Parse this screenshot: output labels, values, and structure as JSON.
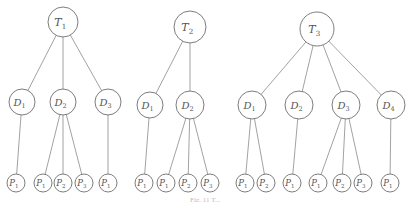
{
  "diagram": {
    "trees": [
      {
        "root": {
          "label": "T",
          "sub": "1",
          "x": 63,
          "y": 22,
          "r": 15
        },
        "children": [
          {
            "label": "D",
            "sub": "1",
            "x": 22,
            "y": 102,
            "r": 13,
            "children": [
              {
                "label": "P",
                "sub": "1",
                "x": 16,
                "y": 183
              }
            ]
          },
          {
            "label": "D",
            "sub": "2",
            "x": 63,
            "y": 102,
            "r": 13,
            "children": [
              {
                "label": "P",
                "sub": "1",
                "x": 43,
                "y": 183
              },
              {
                "label": "P",
                "sub": "2",
                "x": 63,
                "y": 183
              },
              {
                "label": "P",
                "sub": "3",
                "x": 84,
                "y": 183
              }
            ]
          },
          {
            "label": "D",
            "sub": "3",
            "x": 108,
            "y": 102,
            "r": 13,
            "children": [
              {
                "label": "P",
                "sub": "1",
                "x": 108,
                "y": 183
              }
            ]
          }
        ]
      },
      {
        "root": {
          "label": "T",
          "sub": "2",
          "x": 190,
          "y": 27,
          "r": 16
        },
        "children": [
          {
            "label": "D",
            "sub": "1",
            "x": 150,
            "y": 105,
            "r": 13,
            "children": [
              {
                "label": "P",
                "sub": "1",
                "x": 144,
                "y": 183
              }
            ]
          },
          {
            "label": "D",
            "sub": "2",
            "x": 190,
            "y": 105,
            "r": 14,
            "children": [
              {
                "label": "P",
                "sub": "1",
                "x": 166,
                "y": 183
              },
              {
                "label": "P",
                "sub": "2",
                "x": 188,
                "y": 183
              },
              {
                "label": "P",
                "sub": "3",
                "x": 210,
                "y": 183
              }
            ]
          }
        ]
      },
      {
        "root": {
          "label": "T",
          "sub": "3",
          "x": 317,
          "y": 29,
          "r": 17
        },
        "children": [
          {
            "label": "D",
            "sub": "1",
            "x": 252,
            "y": 105,
            "r": 14,
            "children": [
              {
                "label": "P",
                "sub": "1",
                "x": 245,
                "y": 183
              },
              {
                "label": "P",
                "sub": "2",
                "x": 266,
                "y": 183
              }
            ]
          },
          {
            "label": "D",
            "sub": "2",
            "x": 299,
            "y": 105,
            "r": 14,
            "children": [
              {
                "label": "P",
                "sub": "1",
                "x": 292,
                "y": 183
              }
            ]
          },
          {
            "label": "D",
            "sub": "3",
            "x": 346,
            "y": 105,
            "r": 14,
            "children": [
              {
                "label": "P",
                "sub": "1",
                "x": 318,
                "y": 183
              },
              {
                "label": "P",
                "sub": "2",
                "x": 342,
                "y": 183
              },
              {
                "label": "P",
                "sub": "3",
                "x": 363,
                "y": 183
              }
            ]
          },
          {
            "label": "D",
            "sub": "4",
            "x": 391,
            "y": 105,
            "r": 14,
            "children": [
              {
                "label": "P",
                "sub": "1",
                "x": 390,
                "y": 183
              }
            ]
          }
        ]
      }
    ],
    "leaf_radius": 9,
    "caption": "Fig. 11   T..."
  }
}
